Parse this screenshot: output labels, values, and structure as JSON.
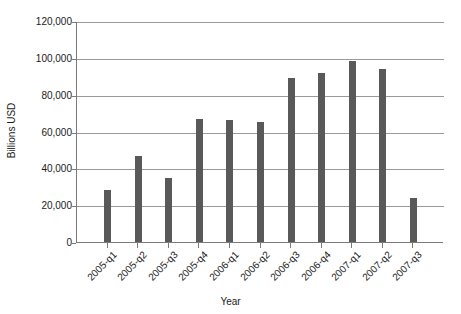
{
  "chart_data": {
    "type": "bar",
    "title": "",
    "xlabel": "Year",
    "ylabel": "Billions USD",
    "categories": [
      "2005-q1",
      "2005-q2",
      "2005-q3",
      "2005-q4",
      "2006-q1",
      "2006-q2",
      "2006-q3",
      "2006-q4",
      "2007-q1",
      "2007-q2",
      "2007-q3"
    ],
    "values": [
      28000,
      46500,
      35000,
      67000,
      66500,
      65000,
      89000,
      92000,
      98500,
      94000,
      24000
    ],
    "ylim": [
      0,
      120000
    ],
    "ytick_values": [
      0,
      20000,
      40000,
      60000,
      80000,
      100000,
      120000
    ],
    "ytick_labels": [
      "0",
      "20,000",
      "40,000",
      "60,000",
      "80,000",
      "100,000",
      "120,000"
    ],
    "grid": true,
    "legend": false,
    "bar_color": "#595959",
    "gridline_color": "#9a9a9a",
    "axis_color": "#7a7a7a",
    "background_color": "#ffffff"
  }
}
